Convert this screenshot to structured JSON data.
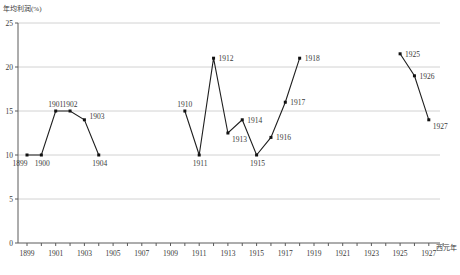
{
  "chart_data": {
    "type": "line",
    "title": "",
    "ylabel": "年均利润(%)",
    "xlabel": "西元年",
    "ylim": [
      0,
      25
    ],
    "y_ticks": [
      0,
      5,
      10,
      15,
      20,
      25
    ],
    "x_range": [
      1899,
      1928
    ],
    "x_tick_step": 1,
    "x_ticks": [
      "1899",
      "1901",
      "1903",
      "1905",
      "1907",
      "1909",
      "1911",
      "1913",
      "1915",
      "1917",
      "1919",
      "1921",
      "1923",
      "1925",
      "1927"
    ],
    "grid": true,
    "legend": "none",
    "marker": "square",
    "colors": {
      "line": "#1f1f1f",
      "marker": "#111111",
      "grid": "#c6c6c6",
      "axis": "#5a5a5a",
      "text": "#3a3a3a",
      "background": "#ffffff"
    },
    "series": [
      {
        "name": "segment-1899-1904",
        "points": [
          {
            "year": 1899,
            "value": 10,
            "label": "1899",
            "label_pos": "below-left"
          },
          {
            "year": 1900,
            "value": 10,
            "label": "1900",
            "label_pos": "below"
          },
          {
            "year": 1901,
            "value": 15,
            "label": "1901",
            "label_pos": "above"
          },
          {
            "year": 1902,
            "value": 15,
            "label": "1902",
            "label_pos": "above"
          },
          {
            "year": 1903,
            "value": 14,
            "label": "1903",
            "label_pos": "right-up"
          },
          {
            "year": 1904,
            "value": 10,
            "label": "1904",
            "label_pos": "below"
          }
        ]
      },
      {
        "name": "segment-1910-1918",
        "points": [
          {
            "year": 1910,
            "value": 15,
            "label": "1910",
            "label_pos": "above"
          },
          {
            "year": 1911,
            "value": 10,
            "label": "1911",
            "label_pos": "below"
          },
          {
            "year": 1912,
            "value": 21,
            "label": "1912",
            "label_pos": "right"
          },
          {
            "year": 1913,
            "value": 12.5,
            "label": "1913",
            "label_pos": "right-down"
          },
          {
            "year": 1914,
            "value": 14,
            "label": "1914",
            "label_pos": "right"
          },
          {
            "year": 1915,
            "value": 10,
            "label": "1915",
            "label_pos": "below"
          },
          {
            "year": 1916,
            "value": 12,
            "label": "1916",
            "label_pos": "right"
          },
          {
            "year": 1917,
            "value": 16,
            "label": "1917",
            "label_pos": "right"
          },
          {
            "year": 1918,
            "value": 21,
            "label": "1918",
            "label_pos": "right"
          }
        ]
      },
      {
        "name": "segment-1925-1927",
        "points": [
          {
            "year": 1925,
            "value": 21.5,
            "label": "1925",
            "label_pos": "right"
          },
          {
            "year": 1926,
            "value": 19,
            "label": "1926",
            "label_pos": "right"
          },
          {
            "year": 1927,
            "value": 14,
            "label": "1927",
            "label_pos": "right-down"
          }
        ]
      }
    ]
  }
}
